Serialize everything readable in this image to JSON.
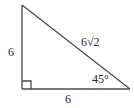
{
  "diagram": {
    "type": "right-triangle",
    "colors": {
      "stroke": "#4a4a4a",
      "text": "#2a2a2a",
      "background": "#ffffff"
    },
    "vertices": {
      "top": [
        22,
        5
      ],
      "right_angle": [
        22,
        89
      ],
      "bottom_right": [
        130,
        89
      ]
    },
    "labels": {
      "vertical_leg": "6",
      "horizontal_leg": "6",
      "hypotenuse": "6√2",
      "angle": "45°"
    },
    "right_angle_marker": true
  }
}
